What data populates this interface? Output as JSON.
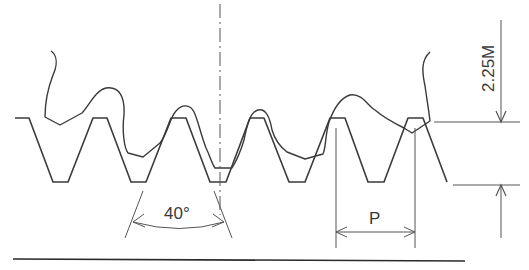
{
  "diagram": {
    "labels": {
      "pressure_angle": "40°",
      "pitch": "P",
      "tooth_depth": "2.25M"
    },
    "colors": {
      "line": "#3a3a3a",
      "thin": "#555555",
      "background": "#ffffff"
    }
  }
}
